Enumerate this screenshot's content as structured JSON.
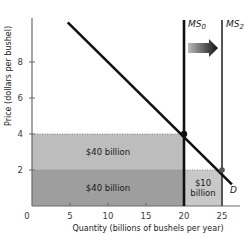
{
  "chart_data": {
    "type": "area",
    "title": "",
    "xlabel": "Quantity (billions of bushels per year)",
    "ylabel": "Price (dollars per bushel)",
    "xlim": [
      0,
      28
    ],
    "ylim": [
      0,
      10.4
    ],
    "x_ticks": [
      0,
      5,
      10,
      15,
      20,
      25
    ],
    "x_tick_labels": [
      "0",
      "5",
      "10",
      "15",
      "20",
      "25"
    ],
    "y_ticks": [
      2,
      4,
      6,
      8
    ],
    "y_tick_labels": [
      "2",
      "4",
      "6",
      "8"
    ],
    "grid": false,
    "series": [
      {
        "name": "D",
        "kind": "demand-line",
        "points": [
          [
            4.7,
            10.2
          ],
          [
            26.3,
            1.2
          ]
        ],
        "label": "D"
      },
      {
        "name": "MS0",
        "kind": "vertical-supply",
        "x": 20,
        "label_main": "MS",
        "label_sub": "0"
      },
      {
        "name": "MS2",
        "kind": "vertical-supply",
        "x": 25,
        "label_main": "MS",
        "label_sub": "2"
      }
    ],
    "equilibria": [
      {
        "name": "initial",
        "quantity": 20,
        "price": 4
      },
      {
        "name": "new",
        "quantity": 25,
        "price": 2
      }
    ],
    "areas": [
      {
        "name": "upper-revenue",
        "x": [
          0,
          20
        ],
        "y": [
          2,
          4
        ],
        "label": "$40 billion",
        "color": "#bdbdbd"
      },
      {
        "name": "lower-revenue",
        "x": [
          0,
          20
        ],
        "y": [
          0,
          2
        ],
        "label": "$40 billion",
        "color": "#9e9e9e"
      },
      {
        "name": "added-revenue",
        "x": [
          20,
          25
        ],
        "y": [
          0,
          2
        ],
        "label_line1": "$10",
        "label_line2": "billion",
        "color": "#c8c8c8"
      }
    ],
    "annotations": [
      {
        "type": "arrow",
        "from": "MS0",
        "to": "MS2",
        "meaning": "supply shift right"
      }
    ]
  },
  "colors": {
    "axis": "#6a6a6a",
    "line": "#111111",
    "ms2": "#555555",
    "arrow_start": "#bbbbbb",
    "arrow_end": "#111111"
  }
}
